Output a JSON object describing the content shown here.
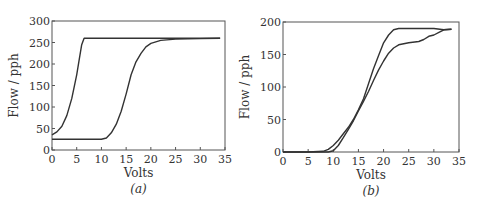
{
  "chart_data": [
    {
      "type": "line",
      "caption": "(a)",
      "title": "",
      "xlabel": "Volts",
      "ylabel": "Flow / pph",
      "xlim": [
        0,
        35
      ],
      "ylim": [
        0,
        300
      ],
      "xticks": [
        0,
        5,
        10,
        15,
        20,
        25,
        30,
        35
      ],
      "yticks": [
        0,
        50,
        100,
        150,
        200,
        250,
        300
      ],
      "grid": false,
      "series": [
        {
          "name": "curve-1",
          "x": [
            0,
            1,
            2,
            3,
            4,
            5,
            5.5,
            6,
            6.5,
            7,
            10,
            20,
            30,
            34
          ],
          "y": [
            35,
            42,
            55,
            80,
            120,
            175,
            210,
            245,
            260,
            260,
            260,
            260,
            260,
            260
          ]
        },
        {
          "name": "curve-2",
          "x": [
            0,
            5,
            10,
            11,
            12,
            13,
            14,
            15,
            16,
            17,
            18,
            19,
            20,
            22,
            25,
            30,
            34
          ],
          "y": [
            25,
            25,
            25,
            28,
            40,
            60,
            90,
            130,
            175,
            205,
            225,
            240,
            248,
            255,
            258,
            259,
            260
          ]
        }
      ]
    },
    {
      "type": "line",
      "caption": "(b)",
      "title": "",
      "xlabel": "Volts",
      "ylabel": "Flow / pph",
      "xlim": [
        0,
        35
      ],
      "ylim": [
        0,
        200
      ],
      "xticks": [
        0,
        5,
        10,
        15,
        20,
        25,
        30,
        35
      ],
      "yticks": [
        0,
        50,
        100,
        150,
        200
      ],
      "grid": false,
      "series": [
        {
          "name": "curve-1",
          "x": [
            0,
            5,
            8,
            9,
            10,
            11,
            12,
            13,
            14,
            15,
            16,
            17,
            18,
            19,
            20,
            21,
            22,
            23,
            25,
            28,
            30,
            32,
            33.5
          ],
          "y": [
            0,
            0,
            1,
            4,
            10,
            18,
            28,
            38,
            50,
            65,
            82,
            105,
            128,
            148,
            168,
            180,
            188,
            190,
            190,
            190,
            190,
            188,
            189
          ]
        },
        {
          "name": "curve-2",
          "x": [
            0,
            5,
            9,
            10,
            11,
            12,
            13,
            14,
            15,
            16,
            17,
            18,
            19,
            20,
            21,
            22,
            23,
            25,
            27,
            28,
            29,
            30,
            31,
            32,
            33.5
          ],
          "y": [
            0,
            0,
            0,
            2,
            10,
            22,
            35,
            48,
            63,
            78,
            93,
            110,
            126,
            140,
            152,
            160,
            165,
            168,
            170,
            173,
            178,
            180,
            184,
            188,
            189
          ]
        }
      ]
    }
  ]
}
